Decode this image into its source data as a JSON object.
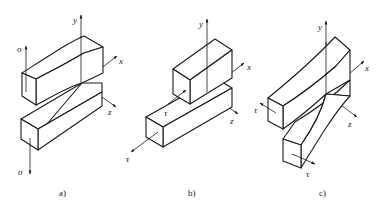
{
  "figure": {
    "panels": [
      {
        "id": "a",
        "caption": "a)",
        "mode": "opening (tension normal to crack plane)",
        "axes": {
          "x": "x",
          "y": "y",
          "z": "z"
        },
        "loads": [
          {
            "symbol": "σ",
            "direction": "up"
          },
          {
            "symbol": "σ",
            "direction": "down"
          }
        ]
      },
      {
        "id": "b",
        "caption": "b)",
        "mode": "in-plane sliding shear",
        "axes": {
          "x": "x",
          "y": "y",
          "z": "z"
        },
        "loads": [
          {
            "symbol": "τ",
            "direction": "+x"
          },
          {
            "symbol": "τ",
            "direction": "-x"
          }
        ]
      },
      {
        "id": "c",
        "caption": "c)",
        "mode": "out-of-plane tearing shear",
        "axes": {
          "x": "x",
          "y": "y",
          "z": "z"
        },
        "loads": [
          {
            "symbol": "τ",
            "direction": "-z"
          },
          {
            "symbol": "τ",
            "direction": "+z"
          }
        ]
      }
    ]
  },
  "colors": {
    "line": "#1a1a1a",
    "background": "#ffffff"
  }
}
